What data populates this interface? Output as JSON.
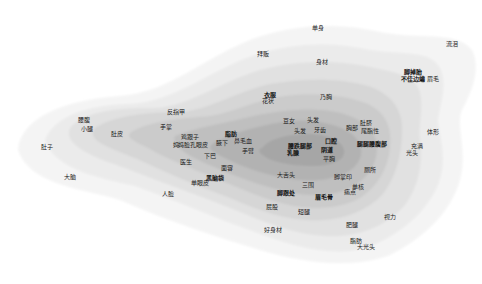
{
  "chart_data": {
    "type": "heatmap",
    "subtype": "word-density-contour-map",
    "title": "",
    "xlabel": "",
    "ylabel": "",
    "grid": false,
    "legend": false,
    "contour_levels": 8,
    "colors": {
      "background": "#ffffff",
      "levels": [
        "#f4f4f4",
        "#ebebeb",
        "#e1e1e1",
        "#d6d6d6",
        "#cbcbcb",
        "#bfbfbf",
        "#b2b2b2",
        "#a6a6a6"
      ]
    },
    "density_peak": {
      "x": 305,
      "y": 150
    },
    "terms": [
      {
        "label": "单身",
        "x": 318,
        "y": 27
      },
      {
        "label": "流泪",
        "x": 452,
        "y": 43
      },
      {
        "label": "拜贩",
        "x": 263,
        "y": 53
      },
      {
        "label": "身材",
        "x": 322,
        "y": 61
      },
      {
        "label": "脚掉胎",
        "x": 413,
        "y": 71,
        "bold": true
      },
      {
        "label": "不佳边编",
        "x": 413,
        "y": 78,
        "bold": true
      },
      {
        "label": "眉毛",
        "x": 433,
        "y": 78
      },
      {
        "label": "衣服",
        "x": 270,
        "y": 94,
        "bold": true
      },
      {
        "label": "花状",
        "x": 268,
        "y": 100
      },
      {
        "label": "乃胸",
        "x": 326,
        "y": 96
      },
      {
        "label": "反指甲",
        "x": 176,
        "y": 111
      },
      {
        "label": "腰腹",
        "x": 84,
        "y": 119
      },
      {
        "label": "小腿",
        "x": 87,
        "y": 128
      },
      {
        "label": "手掌",
        "x": 166,
        "y": 126
      },
      {
        "label": "肚皮",
        "x": 117,
        "y": 133
      },
      {
        "label": "鸡跟子",
        "x": 190,
        "y": 136
      },
      {
        "label": "妈妈脸孔眼皮",
        "x": 190,
        "y": 144
      },
      {
        "label": "脂肪",
        "x": 231,
        "y": 133,
        "bold": true
      },
      {
        "label": "腋下",
        "x": 222,
        "y": 142
      },
      {
        "label": "鼻毛血",
        "x": 243,
        "y": 140
      },
      {
        "label": "手臂",
        "x": 248,
        "y": 150
      },
      {
        "label": "豆女",
        "x": 289,
        "y": 120
      },
      {
        "label": "头发",
        "x": 313,
        "y": 119
      },
      {
        "label": "头发",
        "x": 300,
        "y": 130
      },
      {
        "label": "牙齿",
        "x": 320,
        "y": 129
      },
      {
        "label": "肚脐",
        "x": 366,
        "y": 122
      },
      {
        "label": "胸部",
        "x": 352,
        "y": 127
      },
      {
        "label": "尾脂性",
        "x": 370,
        "y": 130
      },
      {
        "label": "体形",
        "x": 433,
        "y": 131
      },
      {
        "label": "口腔",
        "x": 331,
        "y": 140,
        "bold": true
      },
      {
        "label": "腰跌腿部",
        "x": 300,
        "y": 145,
        "bold": true
      },
      {
        "label": "乳腺",
        "x": 293,
        "y": 152,
        "bold": true
      },
      {
        "label": "阴道",
        "x": 327,
        "y": 149,
        "bold": true
      },
      {
        "label": "平胸",
        "x": 329,
        "y": 158
      },
      {
        "label": "腿腿腰腹部",
        "x": 372,
        "y": 143,
        "bold": true
      },
      {
        "label": "充满",
        "x": 417,
        "y": 145
      },
      {
        "label": "光头",
        "x": 412,
        "y": 152
      },
      {
        "label": "下巴",
        "x": 210,
        "y": 155
      },
      {
        "label": "医生",
        "x": 186,
        "y": 161
      },
      {
        "label": "面容",
        "x": 227,
        "y": 167
      },
      {
        "label": "大舌头",
        "x": 286,
        "y": 174
      },
      {
        "label": "三围",
        "x": 308,
        "y": 184
      },
      {
        "label": "厕所",
        "x": 370,
        "y": 169
      },
      {
        "label": "脚掌印",
        "x": 343,
        "y": 176
      },
      {
        "label": "单核",
        "x": 358,
        "y": 186
      },
      {
        "label": "痛点",
        "x": 350,
        "y": 191
      },
      {
        "label": "单眼皮",
        "x": 200,
        "y": 182
      },
      {
        "label": "黑脑袋",
        "x": 215,
        "y": 177,
        "bold": true
      },
      {
        "label": "人脸",
        "x": 168,
        "y": 193
      },
      {
        "label": "脚跟处",
        "x": 286,
        "y": 192,
        "bold": true
      },
      {
        "label": "眉毛骨",
        "x": 324,
        "y": 196,
        "bold": true
      },
      {
        "label": "屁股",
        "x": 272,
        "y": 206
      },
      {
        "label": "短腿",
        "x": 304,
        "y": 211
      },
      {
        "label": "肥腿",
        "x": 352,
        "y": 224
      },
      {
        "label": "视力",
        "x": 390,
        "y": 216
      },
      {
        "label": "好身材",
        "x": 273,
        "y": 229
      },
      {
        "label": "脂肪",
        "x": 356,
        "y": 240
      },
      {
        "label": "大光头",
        "x": 366,
        "y": 246
      },
      {
        "label": "肚子",
        "x": 47,
        "y": 146
      },
      {
        "label": "大脑",
        "x": 70,
        "y": 176
      }
    ]
  }
}
